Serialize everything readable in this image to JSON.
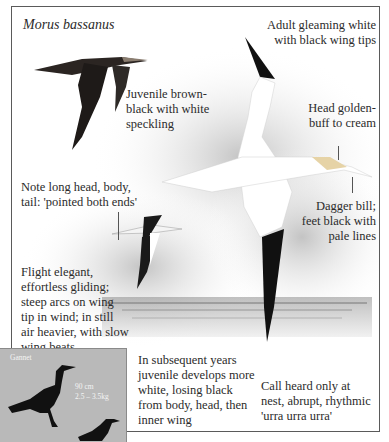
{
  "species": {
    "scientific_name": "Morus bassanus",
    "common_name": "Gannet"
  },
  "annotations": {
    "adult": "Adult gleaming white\nwith black wing tips",
    "juvenile": "Juvenile brown-\nblack with white\nspeckling",
    "head": "Head golden-\nbuff to cream",
    "bill": "Dagger bill;\nfeet black with\npale lines",
    "shape": "Note long head, body,\ntail: 'pointed both ends'",
    "flight": "Flight elegant,\neffortless gliding;\nsteep arcs on wing\ntip in wind; in still\nair heavier, with slow\nwing beats",
    "subsequent": "In subsequent years\njuvenile develops more\nwhite, losing black\nfrom body, head, then\ninner wing",
    "call": "Call heard only at\nnest, abrupt, rhythmic\n'urra urra urra'"
  },
  "size_box": {
    "label": "Gannet",
    "length": "90 cm",
    "weight": "2.5 – 3.5kg"
  },
  "colors": {
    "frame": "#5a5a5a",
    "inset_bg": "#b9b9b9",
    "wing_black": "#1a1a1a",
    "sea": "#9a9a9a"
  }
}
